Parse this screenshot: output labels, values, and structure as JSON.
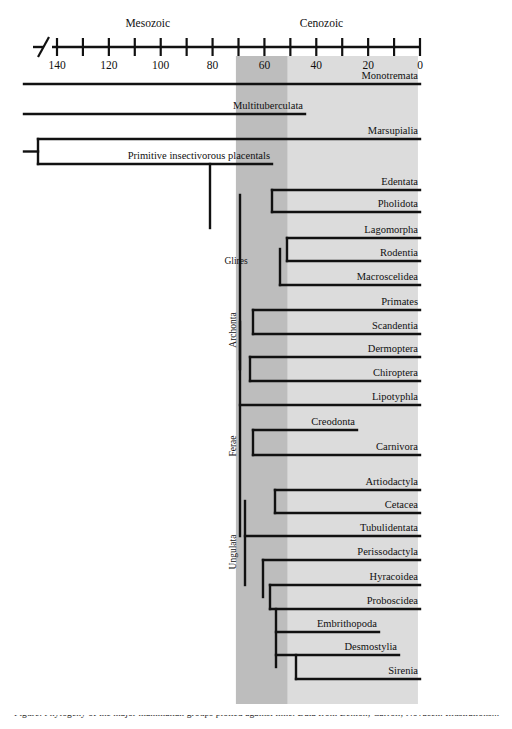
{
  "figure": {
    "caption_partial": "Figure. Phylogeny of the major mammalian groups plotted against time. Data from Benton; Carroll; Novacek. Illustrations..."
  },
  "axis": {
    "unit_note": "Millions of years before present",
    "max_value": 140,
    "min_value": 0,
    "pixels": {
      "x_at_max": 57,
      "x_at_min": 420,
      "y_line": 47
    },
    "ticks": [
      {
        "value": 140,
        "label": "140"
      },
      {
        "value": 130,
        "label": ""
      },
      {
        "value": 120,
        "label": "120"
      },
      {
        "value": 110,
        "label": ""
      },
      {
        "value": 100,
        "label": "100"
      },
      {
        "value": 90,
        "label": ""
      },
      {
        "value": 80,
        "label": "80"
      },
      {
        "value": 70,
        "label": ""
      },
      {
        "value": 60,
        "label": "60"
      },
      {
        "value": 50,
        "label": ""
      },
      {
        "value": 40,
        "label": "40"
      },
      {
        "value": 30,
        "label": ""
      },
      {
        "value": 20,
        "label": "20"
      },
      {
        "value": 10,
        "label": ""
      },
      {
        "value": 0,
        "label": "0"
      }
    ],
    "eras": [
      {
        "name": "Mesozoic",
        "label": "Mesozoic",
        "center_value": 105
      },
      {
        "name": "Cenozoic",
        "label": "Cenozoic",
        "center_value": 38
      }
    ]
  },
  "bands": [
    {
      "name": "dark-band",
      "color": "#bdbdbd",
      "from_value": 71,
      "to_value": 51
    },
    {
      "name": "light-band",
      "color": "#dcdcdc",
      "from_value": 51,
      "to_value": 0.8
    }
  ],
  "colors": {
    "line": "#111111",
    "text": "#101010",
    "band_dark": "#bdbdbd",
    "band_light": "#dcdcdc",
    "background": "#ffffff"
  },
  "clade_labels": [
    {
      "id": "glires",
      "label": "Glires",
      "orientation": "horizontal",
      "x": 236,
      "y": 260
    },
    {
      "id": "archonta",
      "label": "Archonta",
      "orientation": "vertical",
      "x": 236,
      "y": 330
    },
    {
      "id": "ferae",
      "label": "Ferae",
      "orientation": "vertical",
      "x": 236,
      "y": 446
    },
    {
      "id": "ungulata",
      "label": "Ungulata",
      "orientation": "vertical",
      "x": 236,
      "y": 552
    }
  ],
  "taxa": [
    {
      "id": "monotremata",
      "label": "Monotremata",
      "y": 84,
      "start_x": 24,
      "end_x": 420,
      "icon": "platypus-icon"
    },
    {
      "id": "multituberculata",
      "label": "Multituberculata",
      "y": 114,
      "start_x": 24,
      "end_x": 305,
      "icon": null
    },
    {
      "id": "marsupialia",
      "label": "Marsupialia",
      "y": 139,
      "start_x": 38,
      "end_x": 420,
      "icon": "kangaroo-icon"
    },
    {
      "id": "primitive-insectivorous-placentals",
      "label": "Primitive insectivorous placentals",
      "y": 164,
      "start_x": 38,
      "end_x": 272,
      "icon": "shrew-icon"
    },
    {
      "id": "edentata",
      "label": "Edentata",
      "y": 190,
      "start_x": 272,
      "end_x": 420,
      "icon": "anteater-icon"
    },
    {
      "id": "pholidota",
      "label": "Pholidota",
      "y": 212,
      "start_x": 272,
      "end_x": 420,
      "icon": "pangolin-icon"
    },
    {
      "id": "lagomorpha",
      "label": "Lagomorpha",
      "y": 238,
      "start_x": 287,
      "end_x": 420,
      "icon": "rabbit-icon"
    },
    {
      "id": "rodentia",
      "label": "Rodentia",
      "y": 261,
      "start_x": 287,
      "end_x": 420,
      "icon": "squirrel-icon"
    },
    {
      "id": "macroscelidea",
      "label": "Macroscelidea",
      "y": 285,
      "start_x": 280,
      "end_x": 420,
      "icon": "elephant-shrew-icon"
    },
    {
      "id": "primates",
      "label": "Primates",
      "y": 310,
      "start_x": 253,
      "end_x": 420,
      "icon": "primate-icon"
    },
    {
      "id": "scandentia",
      "label": "Scandentia",
      "y": 334,
      "start_x": 253,
      "end_x": 420,
      "icon": "treeshrew-icon"
    },
    {
      "id": "dermoptera",
      "label": "Dermoptera",
      "y": 357,
      "start_x": 250,
      "end_x": 420,
      "icon": "colugo-icon"
    },
    {
      "id": "chiroptera",
      "label": "Chiroptera",
      "y": 381,
      "start_x": 250,
      "end_x": 420,
      "icon": "bat-icon"
    },
    {
      "id": "lipotyphla",
      "label": "Lipotyphla",
      "y": 405,
      "start_x": 240,
      "end_x": 420,
      "icon": "hedgehog-icon"
    },
    {
      "id": "creodonta",
      "label": "Creodonta",
      "y": 430,
      "start_x": 253,
      "end_x": 357,
      "icon": "creodont-icon"
    },
    {
      "id": "carnivora",
      "label": "Carnivora",
      "y": 455,
      "start_x": 253,
      "end_x": 420,
      "icon": "lion-icon"
    },
    {
      "id": "artiodactyla",
      "label": "Artiodactyla",
      "y": 490,
      "start_x": 275,
      "end_x": 420,
      "icon": "deer-icon"
    },
    {
      "id": "cetacea",
      "label": "Cetacea",
      "y": 513,
      "start_x": 275,
      "end_x": 420,
      "icon": "whale-icon"
    },
    {
      "id": "tubulidentata",
      "label": "Tubulidentata",
      "y": 536,
      "start_x": 245,
      "end_x": 420,
      "icon": "aardvark-icon"
    },
    {
      "id": "perissodactyla",
      "label": "Perissodactyla",
      "y": 560,
      "start_x": 263,
      "end_x": 420,
      "icon": "horse-icon"
    },
    {
      "id": "hyracoidea",
      "label": "Hyracoidea",
      "y": 585,
      "start_x": 270,
      "end_x": 420,
      "icon": "hyrax-icon"
    },
    {
      "id": "proboscidea",
      "label": "Proboscidea",
      "y": 609,
      "start_x": 270,
      "end_x": 420,
      "icon": "elephant-icon"
    },
    {
      "id": "embrithopoda",
      "label": "Embrithopoda",
      "y": 632,
      "start_x": 276,
      "end_x": 379,
      "icon": "arsinoitherium-icon"
    },
    {
      "id": "desmostylia",
      "label": "Desmostylia",
      "y": 655,
      "start_x": 276,
      "end_x": 399,
      "icon": "desmostylian-icon"
    },
    {
      "id": "sirenia",
      "label": "Sirenia",
      "y": 679,
      "start_x": 296,
      "end_x": 420,
      "icon": "manatee-icon"
    }
  ],
  "internal_nodes": [
    {
      "id": "root",
      "x": 38,
      "y_top": 139,
      "y_bottom": 164,
      "stub_to_x": 24
    },
    {
      "id": "placental-stem",
      "x": 210,
      "y_top": 164,
      "y_bottom": 228
    },
    {
      "id": "placental-crown",
      "x": 240,
      "y_top": 195,
      "y_bottom": 536
    },
    {
      "id": "xenarthra-node",
      "x": 272,
      "y_top": 190,
      "y_bottom": 212
    },
    {
      "id": "glires-node",
      "x": 287,
      "y_top": 238,
      "y_bottom": 261
    },
    {
      "id": "glires-macro-node",
      "x": 280,
      "y_top": 249,
      "y_bottom": 285
    },
    {
      "id": "archonta-upper",
      "x": 253,
      "y_top": 310,
      "y_bottom": 334
    },
    {
      "id": "archonta-lower",
      "x": 250,
      "y_top": 357,
      "y_bottom": 381
    },
    {
      "id": "archonta-node",
      "x": 240,
      "y_top": 322,
      "y_bottom": 369
    },
    {
      "id": "ferae-node",
      "x": 253,
      "y_top": 430,
      "y_bottom": 455
    },
    {
      "id": "cetartio-node",
      "x": 275,
      "y_top": 490,
      "y_bottom": 513
    },
    {
      "id": "ungulata-node",
      "x": 245,
      "y_top": 501,
      "y_bottom": 585
    },
    {
      "id": "paenungulata-node",
      "x": 263,
      "y_top": 560,
      "y_bottom": 597
    },
    {
      "id": "tethytheria-node",
      "x": 270,
      "y_top": 585,
      "y_bottom": 609
    },
    {
      "id": "tethy-lower",
      "x": 276,
      "y_top": 609,
      "y_bottom": 667
    },
    {
      "id": "sirenia-node",
      "x": 296,
      "y_top": 655,
      "y_bottom": 679
    }
  ]
}
